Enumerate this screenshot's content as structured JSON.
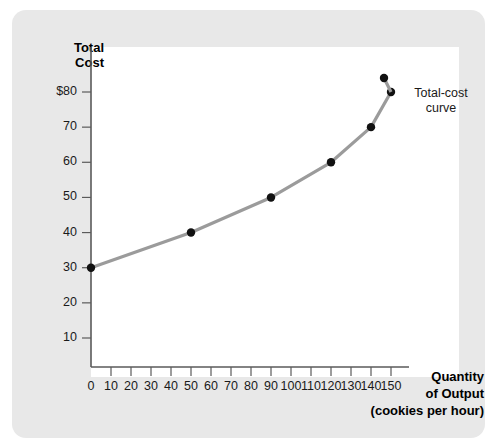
{
  "figure": {
    "panel_background": "#e8e8e8",
    "plot_background": "#ffffff"
  },
  "chart_data": {
    "type": "line",
    "title": "",
    "xlabel": "Quantity of Output",
    "xlabel_line1": "Quantity",
    "xlabel_line2": "of Output",
    "xlabel_line3": "(cookies per hour)",
    "ylabel": "Total Cost",
    "ylabel_line1": "Total",
    "ylabel_line2": "Cost",
    "xlim": [
      0,
      150
    ],
    "ylim": [
      0,
      87
    ],
    "grid": false,
    "legend_position": "inline-annotation",
    "xticks": [
      0,
      10,
      20,
      30,
      40,
      50,
      60,
      70,
      80,
      90,
      100,
      110,
      120,
      130,
      140,
      150
    ],
    "xtick_labels": [
      "0",
      "10",
      "20",
      "30",
      "40",
      "50",
      "60",
      "70",
      "80",
      "90",
      "100",
      "110",
      "120",
      "130",
      "140",
      "150"
    ],
    "yticks": [
      10,
      20,
      30,
      40,
      50,
      60,
      70,
      80
    ],
    "ytick_labels": [
      "10",
      "20",
      "30",
      "40",
      "50",
      "60",
      "70",
      "$80"
    ],
    "series": [
      {
        "name": "Total-cost curve",
        "annotation_line1": "Total-cost",
        "annotation_line2": "curve",
        "color": "#9b9b9b",
        "marker_color": "#111111",
        "x": [
          0,
          50,
          90,
          120,
          140,
          150
        ],
        "values": [
          30,
          40,
          50,
          60,
          70,
          80
        ],
        "points": [
          {
            "x": 0,
            "y": 30
          },
          {
            "x": 50,
            "y": 40
          },
          {
            "x": 90,
            "y": 50
          },
          {
            "x": 120,
            "y": 60
          },
          {
            "x": 140,
            "y": 70
          },
          {
            "x": 150,
            "y": 80
          }
        ]
      }
    ]
  }
}
